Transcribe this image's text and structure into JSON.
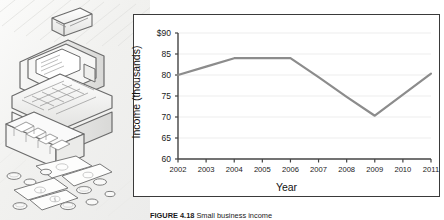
{
  "figure": {
    "caption_label": "FIGURE 4.18",
    "caption_text": "Small business income"
  },
  "illustration": {
    "name": "cash-register-with-money-illustration",
    "alt": "Line drawing of a cash register with open drawer, bills and coins"
  },
  "chart_data": {
    "type": "line",
    "title": "",
    "xlabel": "Year",
    "ylabel": "Income (thousands)",
    "x": [
      2002,
      2003,
      2004,
      2005,
      2006,
      2007,
      2008,
      2009,
      2010,
      2011
    ],
    "categories": [
      "2002",
      "2003",
      "2004",
      "2005",
      "2006",
      "2007",
      "2008",
      "2009",
      "2010",
      "2011"
    ],
    "values": [
      80.0,
      82.0,
      84.0,
      84.0,
      84.0,
      79.5,
      74.8,
      70.3,
      75.3,
      80.3
    ],
    "series": [
      {
        "name": "Income",
        "values": [
          80.0,
          82.0,
          84.0,
          84.0,
          84.0,
          79.5,
          74.8,
          70.3,
          75.3,
          80.3
        ],
        "color": "#8c8c8c"
      }
    ],
    "ylim": [
      60,
      90
    ],
    "yticks": [
      60,
      65,
      70,
      75,
      80,
      85,
      90
    ],
    "ytick_labels": [
      "60",
      "65",
      "70",
      "75",
      "80",
      "85",
      "$90"
    ],
    "xlim": [
      2002,
      2011
    ],
    "xticks": [
      2002,
      2003,
      2004,
      2005,
      2006,
      2007,
      2008,
      2009,
      2010,
      2011
    ],
    "grid": true,
    "grid_axis": "y",
    "legend": false,
    "legend_position": "none",
    "line_color": "#8c8c8c",
    "grid_color": "#ededed",
    "axis_color": "#444444",
    "panel_background": "#ffffff",
    "panel_border_color": "#3a3a3a"
  }
}
